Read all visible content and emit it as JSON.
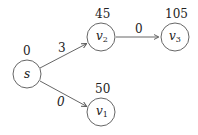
{
  "nodes": [
    {
      "id": "s",
      "label": "s",
      "sub": "",
      "value": "0",
      "x": 27,
      "y": 74
    },
    {
      "id": "v2",
      "label": "v",
      "sub": "2",
      "value": "45",
      "x": 101,
      "y": 37
    },
    {
      "id": "v3",
      "label": "v",
      "sub": "3",
      "value": "105",
      "x": 175,
      "y": 37
    },
    {
      "id": "v1",
      "label": "v",
      "sub": "1",
      "value": "50",
      "x": 101,
      "y": 112
    }
  ],
  "edges": [
    {
      "from": "s",
      "to": "v2",
      "weight": "3"
    },
    {
      "from": "v2",
      "to": "v3",
      "weight": "0"
    },
    {
      "from": "s",
      "to": "v1",
      "weight": "0"
    }
  ],
  "colors": {
    "stroke": "#555555",
    "text": "#222222"
  }
}
